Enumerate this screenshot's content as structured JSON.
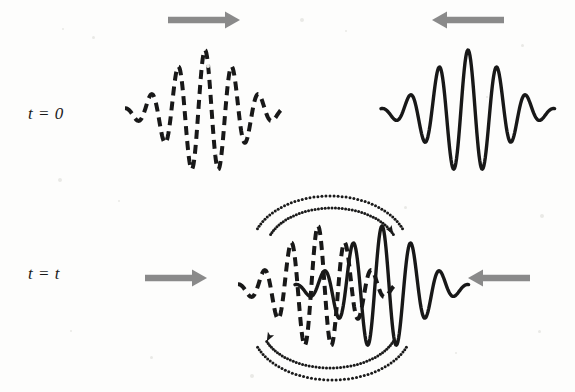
{
  "figure": {
    "background_color": "#fdfdfc",
    "wave_color": "#181818",
    "arrow_color": "#8a8a8a",
    "dotted_color": "#1a1a1a"
  },
  "labels": {
    "t_zero": "t = 0",
    "t_t": "t = t"
  },
  "rows": [
    {
      "name": "row-t0",
      "baseline_y": 112,
      "packets": [
        {
          "id": "left-packet-t0",
          "style": "dashed",
          "center_x": 205,
          "half_width": 80,
          "envelope_sigma": 34,
          "wavelength": 27,
          "amplitude": 62,
          "phase": 0,
          "direction": "right"
        },
        {
          "id": "right-packet-t0",
          "style": "solid",
          "center_x": 468,
          "half_width": 87,
          "envelope_sigma": 36,
          "wavelength": 29,
          "amplitude": 62,
          "phase": 0,
          "direction": "left"
        }
      ],
      "arrows": [
        {
          "id": "arrow-right-t0",
          "direction": "right",
          "x": 168,
          "y": 20,
          "length": 72
        },
        {
          "id": "arrow-left-t0",
          "direction": "left",
          "x": 432,
          "y": 20,
          "length": 72
        }
      ]
    },
    {
      "name": "row-tt",
      "baseline_y": 288,
      "packets": [
        {
          "id": "left-packet-tt",
          "style": "dashed",
          "center_x": 318,
          "half_width": 80,
          "envelope_sigma": 34,
          "wavelength": 27,
          "amplitude": 62,
          "phase": 0,
          "direction": "right"
        },
        {
          "id": "right-packet-tt",
          "style": "solid",
          "center_x": 382,
          "half_width": 87,
          "envelope_sigma": 36,
          "wavelength": 29,
          "amplitude": 62,
          "phase": 0,
          "direction": "left"
        }
      ],
      "arrows": [
        {
          "id": "arrow-right-tt",
          "direction": "right",
          "x": 145,
          "y": 278,
          "length": 62
        },
        {
          "id": "arrow-left-tt",
          "direction": "left",
          "x": 468,
          "y": 278,
          "length": 62
        }
      ],
      "interaction_arcs": [
        {
          "id": "arc-top-outer",
          "position": "top",
          "cx": 330,
          "cy": 248,
          "rx": 78,
          "ry": 52
        },
        {
          "id": "arc-top-inner",
          "position": "top",
          "cx": 332,
          "cy": 250,
          "rx": 66,
          "ry": 42
        },
        {
          "id": "arc-bottom-outer",
          "position": "bottom",
          "cx": 332,
          "cy": 328,
          "rx": 80,
          "ry": 52
        },
        {
          "id": "arc-bottom-inner",
          "position": "bottom",
          "cx": 330,
          "cy": 326,
          "rx": 68,
          "ry": 42
        }
      ]
    }
  ],
  "chart_data": {
    "type": "line",
    "xlabel": "",
    "ylabel": "",
    "annotations": [
      "t = 0",
      "t = t"
    ],
    "series": [
      {
        "name": "left-packet-t0",
        "linestyle": "dashed",
        "function": "exp(-((x-205)^2)/(2*34^2)) * cos(2*pi*(x-205)/27)",
        "center": 205,
        "amplitude": 62,
        "wavelength": 27
      },
      {
        "name": "right-packet-t0",
        "linestyle": "solid",
        "function": "exp(-((x-468)^2)/(2*36^2)) * cos(2*pi*(x-468)/29)",
        "center": 468,
        "amplitude": 62,
        "wavelength": 29
      },
      {
        "name": "left-packet-tt",
        "linestyle": "dashed",
        "function": "exp(-((x-318)^2)/(2*34^2)) * cos(2*pi*(x-318)/27)",
        "center": 318,
        "amplitude": 62,
        "wavelength": 27
      },
      {
        "name": "right-packet-tt",
        "linestyle": "solid",
        "function": "exp(-((x-382)^2)/(2*36^2)) * cos(2*pi*(x-382)/29)",
        "center": 382,
        "amplitude": 62,
        "wavelength": 29
      }
    ]
  }
}
